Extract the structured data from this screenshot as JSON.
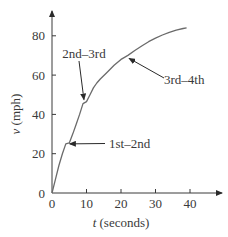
{
  "chart_data": {
    "type": "line",
    "title": "",
    "xlabel": "t (seconds)",
    "xlabel_var": "t",
    "xlabel_unit": "(seconds)",
    "ylabel": "v (mph)",
    "ylabel_var": "v",
    "ylabel_unit": "(mph)",
    "xlim": [
      0,
      46
    ],
    "ylim": [
      0,
      88
    ],
    "xticks": [
      0,
      10,
      20,
      30,
      40
    ],
    "yticks": [
      0,
      20,
      40,
      60,
      80
    ],
    "grid": false,
    "legend": null,
    "series": [
      {
        "name": "velocity",
        "x": [
          0,
          1,
          2,
          3,
          4,
          5,
          6,
          7,
          8,
          9,
          10,
          11,
          12,
          13,
          14,
          16,
          18,
          20,
          21,
          22,
          24,
          26,
          28,
          30,
          32,
          34,
          36,
          38,
          39
        ],
        "y": [
          0,
          7,
          14,
          20,
          25,
          25.5,
          30,
          35,
          40,
          45.5,
          46.5,
          50,
          53.5,
          56,
          58,
          61.5,
          65,
          68,
          69,
          70,
          72.5,
          74.8,
          77,
          78.8,
          80.4,
          81.8,
          82.9,
          83.7,
          84
        ]
      }
    ],
    "annotations": [
      {
        "text": "1st–2nd",
        "point": [
          4.5,
          25
        ],
        "label_pos": [
          26,
          25
        ]
      },
      {
        "text": "2nd–3rd",
        "point": [
          9.5,
          46
        ],
        "label_pos": [
          9,
          71
        ]
      },
      {
        "text": "3rd–4th",
        "point": [
          22,
          69.5
        ],
        "label_pos": [
          38,
          58
        ]
      }
    ]
  },
  "colors": {
    "line": "#6b6b6b",
    "axis": "#3a3a3a",
    "text": "#3a3a3a"
  }
}
